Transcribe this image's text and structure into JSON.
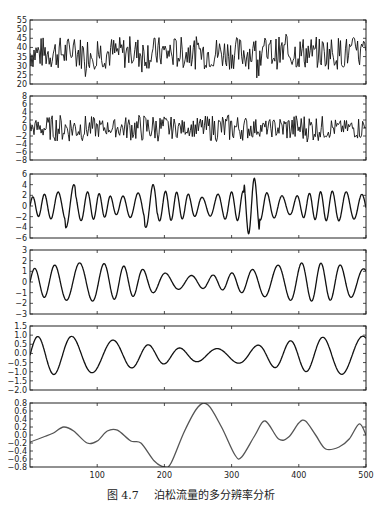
{
  "caption": {
    "number": "图 4.7",
    "text": "泊松流量的多分辨率分析"
  },
  "chart_data": {
    "type": "line",
    "title": "泊松流量的多分辨率分析",
    "xlabel": "",
    "ylabel": "",
    "xlim": [
      0,
      500
    ],
    "x_ticks": [
      100,
      200,
      300,
      400,
      500
    ],
    "grid": false,
    "legend": null,
    "panels": [
      {
        "name": "original-poisson-traffic",
        "ylim": [
          20,
          55
        ],
        "y_ticks": [
          20,
          25,
          30,
          35,
          40,
          45,
          50,
          55
        ],
        "line_color": "#111111",
        "description": "raw Poisson traffic, mean ~37, noisy"
      },
      {
        "name": "detail-level-1",
        "ylim": [
          -8,
          8
        ],
        "y_ticks": [
          -8,
          -6,
          -4,
          -2,
          0,
          2,
          4,
          6,
          8
        ],
        "line_color": "#111111",
        "description": "high-frequency detail, amplitude ~±4"
      },
      {
        "name": "detail-level-2",
        "ylim": [
          -6,
          6
        ],
        "y_ticks": [
          -6,
          -4,
          -2,
          0,
          2,
          4,
          6
        ],
        "line_color": "#111111",
        "description": "detail, amplitude ~±3, spikes to ±5 near x=330"
      },
      {
        "name": "detail-level-3",
        "ylim": [
          -3,
          3
        ],
        "y_ticks": [
          -3,
          -2,
          -1,
          0,
          1,
          2,
          3
        ],
        "line_color": "#111111",
        "description": "smoother detail, amplitude ~±2"
      },
      {
        "name": "detail-level-4",
        "ylim": [
          -2.0,
          1.5
        ],
        "y_ticks": [
          -2.0,
          -1.5,
          -1.0,
          -0.5,
          0.0,
          0.5,
          1.0,
          1.5
        ],
        "line_color": "#111111",
        "description": "low-frequency oscillation, amplitude ~±1"
      },
      {
        "name": "approximation",
        "ylim": [
          -0.8,
          0.8
        ],
        "y_ticks": [
          -0.8,
          -0.6,
          -0.4,
          -0.2,
          0.0,
          0.2,
          0.4,
          0.6,
          0.8
        ],
        "line_color": "#555555",
        "description": "coarse approximation",
        "points": [
          [
            0,
            -0.18
          ],
          [
            20,
            -0.05
          ],
          [
            35,
            0.05
          ],
          [
            50,
            0.2
          ],
          [
            65,
            0.1
          ],
          [
            85,
            -0.2
          ],
          [
            100,
            -0.15
          ],
          [
            115,
            0.1
          ],
          [
            130,
            0.12
          ],
          [
            150,
            -0.15
          ],
          [
            165,
            -0.2
          ],
          [
            185,
            -0.65
          ],
          [
            200,
            -0.8
          ],
          [
            210,
            -0.7
          ],
          [
            230,
            0.1
          ],
          [
            250,
            0.7
          ],
          [
            265,
            0.75
          ],
          [
            285,
            0.2
          ],
          [
            305,
            -0.5
          ],
          [
            315,
            -0.55
          ],
          [
            335,
            0.0
          ],
          [
            350,
            0.35
          ],
          [
            370,
            -0.1
          ],
          [
            385,
            -0.05
          ],
          [
            400,
            0.3
          ],
          [
            410,
            0.35
          ],
          [
            425,
            0.0
          ],
          [
            440,
            -0.35
          ],
          [
            460,
            -0.3
          ],
          [
            475,
            -0.1
          ],
          [
            490,
            0.28
          ],
          [
            500,
            0.0
          ]
        ]
      }
    ]
  }
}
